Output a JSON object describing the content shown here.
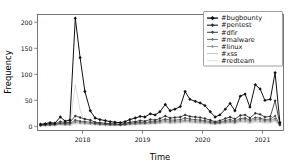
{
  "chart_data": {
    "type": "line",
    "title": "",
    "xlabel": "Time",
    "ylabel": "Frequency",
    "xlim": [
      2017.25,
      2021.35
    ],
    "ylim": [
      -8,
      215
    ],
    "yticks": [
      0,
      50,
      100,
      150,
      200
    ],
    "ytick_labels": [
      "0",
      "50",
      "100",
      "150",
      "200"
    ],
    "xticks": [
      2018,
      2019,
      2020,
      2021
    ],
    "xtick_labels": [
      "2018",
      "2019",
      "2020",
      "2021"
    ],
    "grid": false,
    "legend_position": "upper right",
    "x": [
      2017.3,
      2017.38,
      2017.46,
      2017.54,
      2017.63,
      2017.71,
      2017.79,
      2017.88,
      2017.96,
      2018.04,
      2018.13,
      2018.21,
      2018.29,
      2018.38,
      2018.46,
      2018.54,
      2018.63,
      2018.71,
      2018.79,
      2018.88,
      2018.96,
      2019.04,
      2019.13,
      2019.21,
      2019.29,
      2019.38,
      2019.46,
      2019.54,
      2019.63,
      2019.71,
      2019.79,
      2019.88,
      2019.96,
      2020.04,
      2020.13,
      2020.21,
      2020.29,
      2020.38,
      2020.46,
      2020.54,
      2020.63,
      2020.71,
      2020.79,
      2020.88,
      2020.96,
      2021.04,
      2021.13,
      2021.21,
      2021.29
    ],
    "series": [
      {
        "name": "#bugbounty",
        "color": "#111111",
        "linewidth": 1.0,
        "marker": "diamond",
        "values": [
          4,
          5,
          7,
          6,
          18,
          10,
          12,
          208,
          132,
          67,
          30,
          16,
          13,
          11,
          9,
          8,
          7,
          9,
          13,
          16,
          19,
          18,
          24,
          22,
          28,
          42,
          30,
          33,
          38,
          67,
          52,
          48,
          45,
          40,
          28,
          18,
          22,
          33,
          44,
          30,
          58,
          62,
          37,
          80,
          72,
          50,
          52,
          103,
          7
        ]
      },
      {
        "name": "#pentest",
        "color": "#303030",
        "linewidth": 0.85,
        "marker": "diamond",
        "values": [
          3,
          4,
          5,
          5,
          9,
          7,
          8,
          20,
          17,
          14,
          12,
          8,
          7,
          6,
          5,
          5,
          4,
          6,
          8,
          9,
          11,
          10,
          13,
          12,
          15,
          20,
          16,
          17,
          18,
          22,
          19,
          18,
          17,
          15,
          12,
          9,
          11,
          15,
          18,
          14,
          21,
          22,
          16,
          25,
          23,
          18,
          19,
          49,
          4
        ]
      },
      {
        "name": "#dfir",
        "color": "#4a4a4a",
        "linewidth": 0.75,
        "marker": "diamond",
        "values": [
          2,
          3,
          3,
          4,
          6,
          5,
          6,
          12,
          10,
          9,
          8,
          6,
          5,
          4,
          4,
          4,
          3,
          4,
          6,
          7,
          8,
          7,
          9,
          9,
          11,
          14,
          12,
          12,
          13,
          16,
          14,
          13,
          12,
          11,
          9,
          7,
          8,
          11,
          13,
          10,
          15,
          16,
          12,
          17,
          16,
          13,
          14,
          20,
          3
        ]
      },
      {
        "name": "#malware",
        "color": "#757575",
        "linewidth": 0.7,
        "marker": "diamond",
        "values": [
          2,
          2,
          3,
          3,
          5,
          4,
          4,
          9,
          8,
          7,
          6,
          5,
          4,
          4,
          3,
          3,
          3,
          3,
          5,
          5,
          6,
          6,
          7,
          7,
          9,
          11,
          9,
          10,
          10,
          12,
          11,
          10,
          10,
          9,
          7,
          6,
          7,
          9,
          10,
          8,
          12,
          13,
          10,
          14,
          13,
          11,
          11,
          15,
          2
        ]
      },
      {
        "name": "#linux",
        "color": "#9a9a9a",
        "linewidth": 0.65,
        "marker": "diamond",
        "values": [
          1,
          2,
          2,
          2,
          4,
          3,
          3,
          7,
          6,
          5,
          5,
          4,
          3,
          3,
          2,
          2,
          2,
          3,
          4,
          4,
          5,
          5,
          6,
          6,
          7,
          9,
          7,
          8,
          8,
          10,
          9,
          8,
          8,
          7,
          6,
          5,
          6,
          7,
          8,
          7,
          10,
          10,
          8,
          11,
          10,
          9,
          9,
          12,
          2
        ]
      },
      {
        "name": "#xss",
        "color": "#c2c2c2",
        "linewidth": 0.6,
        "marker": "none",
        "values": [
          1,
          1,
          2,
          2,
          3,
          2,
          3,
          80,
          32,
          5,
          4,
          3,
          3,
          2,
          2,
          2,
          2,
          2,
          3,
          3,
          4,
          4,
          5,
          5,
          6,
          7,
          6,
          6,
          7,
          8,
          7,
          7,
          6,
          6,
          5,
          4,
          5,
          6,
          7,
          5,
          8,
          8,
          6,
          9,
          8,
          7,
          7,
          10,
          1
        ]
      },
      {
        "name": "#redteam",
        "color": "#dddddd",
        "linewidth": 0.6,
        "marker": "none",
        "values": [
          1,
          1,
          1,
          1,
          2,
          2,
          2,
          4,
          4,
          3,
          3,
          2,
          2,
          2,
          1,
          1,
          1,
          2,
          2,
          3,
          3,
          3,
          4,
          4,
          5,
          6,
          5,
          5,
          5,
          7,
          6,
          6,
          5,
          5,
          4,
          3,
          4,
          5,
          6,
          4,
          7,
          7,
          5,
          8,
          7,
          6,
          6,
          9,
          1
        ]
      }
    ]
  },
  "axes": {
    "ylabel": "Frequency",
    "xlabel": "Time"
  },
  "legend": {
    "items": [
      {
        "label": "#bugbounty"
      },
      {
        "label": "#pentest"
      },
      {
        "label": "#dfir"
      },
      {
        "label": "#malware"
      },
      {
        "label": "#linux"
      },
      {
        "label": "#xss"
      },
      {
        "label": "#redteam"
      }
    ]
  }
}
